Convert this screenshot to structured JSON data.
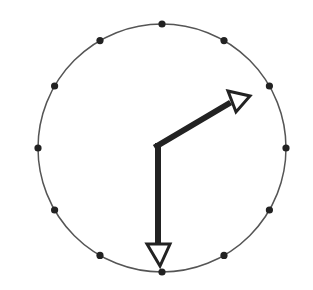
{
  "diagram": {
    "type": "analog-clock",
    "face": {
      "cx": 162,
      "cy": 148,
      "r": 124,
      "stroke": "#555555"
    },
    "hour_markers": {
      "count": 12,
      "radius": 3.6,
      "color": "#222222"
    },
    "hands": {
      "hour": {
        "from": [
          157,
          145
        ],
        "to": [
          250,
          95
        ],
        "shape": "open-arrowhead"
      },
      "minute": {
        "from": [
          157,
          145
        ],
        "to": [
          160,
          268
        ],
        "shape": "open-arrowhead"
      }
    },
    "time_shown": "2:30",
    "ink_color": "#222222"
  }
}
